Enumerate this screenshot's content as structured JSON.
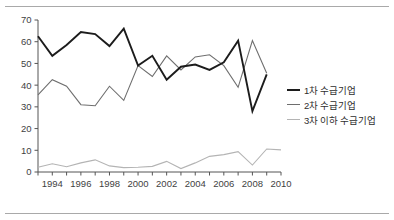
{
  "chart_data": {
    "type": "line",
    "title": "",
    "subtitle": "",
    "xlabel": "",
    "ylabel": "",
    "xlim": [
      1993,
      2010
    ],
    "ylim": [
      0,
      70
    ],
    "ytick_step": 10,
    "grid": false,
    "legend_position": "right",
    "x": [
      1993,
      1994,
      1995,
      1996,
      1997,
      1998,
      1999,
      2000,
      2001,
      2002,
      2003,
      2004,
      2005,
      2006,
      2007,
      2008,
      2009,
      2010
    ],
    "xtick_labels": [
      "1994",
      "1996",
      "1998",
      "2000",
      "2002",
      "2004",
      "2006",
      "2008",
      "2010"
    ],
    "xtick_values": [
      1994,
      1996,
      1998,
      2000,
      2002,
      2004,
      2006,
      2008,
      2010
    ],
    "ytick_labels": [
      "0",
      "10",
      "20",
      "30",
      "40",
      "50",
      "60",
      "70"
    ],
    "ytick_values": [
      0,
      10,
      20,
      30,
      40,
      50,
      60,
      70
    ],
    "series": [
      {
        "name": "1차 수급기업",
        "color": "#1c1c1c",
        "values": [
          62.5,
          53.5,
          58.5,
          64.5,
          63.5,
          58.0,
          66.0,
          49.0,
          53.5,
          42.5,
          48.5,
          49.5,
          47.0,
          50.5,
          60.5,
          28.0,
          45.0,
          null
        ]
      },
      {
        "name": "2차 수급기업",
        "color": "#6e6e6e",
        "values": [
          35.5,
          42.5,
          39.5,
          31.0,
          30.5,
          39.5,
          33.0,
          49.0,
          44.0,
          53.5,
          47.0,
          53.0,
          54.0,
          49.0,
          39.0,
          60.5,
          45.5,
          null
        ]
      },
      {
        "name": "3차 이하 수급기업",
        "color": "#b4b4b4",
        "values": [
          2.2,
          3.8,
          2.4,
          4.2,
          5.6,
          2.8,
          2.0,
          2.2,
          2.6,
          4.9,
          1.6,
          4.2,
          7.2,
          8.0,
          9.4,
          3.2,
          10.6,
          10.2
        ]
      }
    ]
  },
  "legend": {
    "items": [
      {
        "label": "1차 수급기업",
        "color": "#1c1c1c",
        "thickness": 2.4
      },
      {
        "label": "2차 수급기업",
        "color": "#6e6e6e",
        "thickness": 1.6
      },
      {
        "label": "3차 이하 수급기업",
        "color": "#b4b4b4",
        "thickness": 1.6
      }
    ]
  }
}
